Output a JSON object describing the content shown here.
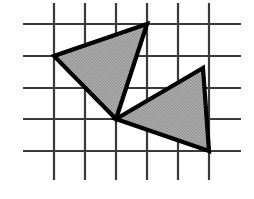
{
  "figure": {
    "type": "geometry-diagram",
    "canvas": {
      "width": 254,
      "height": 199,
      "background": "#ffffff"
    },
    "grid": {
      "label": "square lattice grid",
      "cell_size_px": 31,
      "line_color": "#3a3a3a",
      "line_width_px": 2.2,
      "vertical_lines_x": [
        54,
        85,
        116,
        147,
        178,
        209
      ],
      "vertical_span_y": [
        3,
        180
      ],
      "horizontal_lines_y": [
        24,
        56,
        88,
        119,
        151
      ],
      "horizontal_span_x": [
        23,
        241
      ],
      "columns": 5,
      "rows": 4
    },
    "style": {
      "fill_color": "#a9a9a9",
      "fill_pattern": "halftone-dither",
      "outline_color": "#000000",
      "outline_width_px": 4.2
    },
    "shapes": [
      {
        "name": "upper-left-triangle",
        "label": "Triangle 1",
        "vertices_px": [
          [
            147,
            24
          ],
          [
            54,
            56
          ],
          [
            116,
            119
          ]
        ],
        "vertices_grid": [
          [
            3,
            0
          ],
          [
            0,
            1
          ],
          [
            2,
            3
          ]
        ],
        "fill": "#a9a9a9"
      },
      {
        "name": "lower-right-triangle",
        "label": "Triangle 2",
        "vertices_px": [
          [
            116,
            119
          ],
          [
            203,
            68
          ],
          [
            209,
            151
          ]
        ],
        "vertices_grid": [
          [
            2,
            3
          ],
          [
            4.8,
            1.4
          ],
          [
            5,
            4
          ]
        ],
        "fill": "#a9a9a9"
      }
    ],
    "shared_vertex_px": [
      116,
      119
    ]
  }
}
